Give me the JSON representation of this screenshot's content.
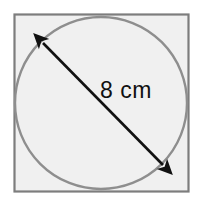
{
  "figure": {
    "canvas": {
      "width": 203,
      "height": 206,
      "background": "#ffffff"
    },
    "square": {
      "name": "square-outline",
      "x": 14.5,
      "y": 14.5,
      "width": 174,
      "height": 177,
      "stroke": "#7d7d7d",
      "stroke_width": 2.2,
      "fill": "#f0f0f0"
    },
    "circle": {
      "name": "inscribed-circle",
      "cx": 101,
      "cy": 103,
      "r": 86,
      "stroke": "#8e8e8e",
      "stroke_width": 2.4,
      "fill": "#f0f0f0"
    },
    "diameter_arrow": {
      "name": "diameter-arrow",
      "x1": 43,
      "y1": 43,
      "x2": 163,
      "y2": 165,
      "stroke": "#111111",
      "stroke_width": 2.6,
      "arrowheads": "both",
      "label": "8 cm",
      "label_x": 100,
      "label_y": 98
    }
  }
}
